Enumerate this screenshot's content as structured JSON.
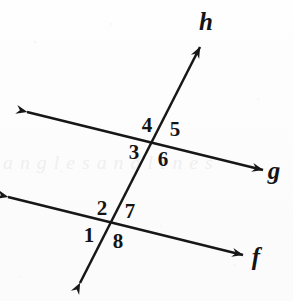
{
  "figure": {
    "background_color": "#fdfdfd",
    "ink_color": "#171717",
    "width": 293,
    "height": 301
  },
  "lines": [
    {
      "id": "line-h",
      "label": "h",
      "role": "transversal",
      "label_x": 206,
      "label_y": 24,
      "x1": 80,
      "y1": 283,
      "x2": 200,
      "y2": 47,
      "arrow_start": true,
      "arrow_end": true
    },
    {
      "id": "line-g",
      "label": "g",
      "role": "parallel-upper",
      "label_x": 274,
      "label_y": 173,
      "x1": 27,
      "y1": 112,
      "x2": 263,
      "y2": 170,
      "arrow_start": true,
      "arrow_end": true
    },
    {
      "id": "line-f",
      "label": "f",
      "role": "parallel-lower",
      "label_x": 256,
      "label_y": 259,
      "x1": 8,
      "y1": 197,
      "x2": 243,
      "y2": 255,
      "arrow_start": true,
      "arrow_end": true
    }
  ],
  "intersections": [
    {
      "id": "intersection-upper",
      "of": "h-and-g",
      "x": 155,
      "y": 143
    },
    {
      "id": "intersection-lower",
      "of": "h-and-f",
      "x": 110,
      "y": 225
    }
  ],
  "angle_labels": [
    {
      "id": "angle-4",
      "text": "4",
      "x": 147,
      "y": 127,
      "intersection": "intersection-upper",
      "position": "upper-left"
    },
    {
      "id": "angle-5",
      "text": "5",
      "x": 175,
      "y": 131,
      "intersection": "intersection-upper",
      "position": "upper-right"
    },
    {
      "id": "angle-3",
      "text": "3",
      "x": 134,
      "y": 154,
      "intersection": "intersection-upper",
      "position": "lower-left"
    },
    {
      "id": "angle-6",
      "text": "6",
      "x": 163,
      "y": 161,
      "intersection": "intersection-upper",
      "position": "lower-right"
    },
    {
      "id": "angle-2",
      "text": "2",
      "x": 102,
      "y": 210,
      "intersection": "intersection-lower",
      "position": "upper-left"
    },
    {
      "id": "angle-7",
      "text": "7",
      "x": 130,
      "y": 213,
      "intersection": "intersection-lower",
      "position": "upper-right"
    },
    {
      "id": "angle-1",
      "text": "1",
      "x": 89,
      "y": 237,
      "intersection": "intersection-lower",
      "position": "lower-left"
    },
    {
      "id": "angle-8",
      "text": "8",
      "x": 118,
      "y": 243,
      "intersection": "intersection-lower",
      "position": "lower-right"
    }
  ],
  "watermark": {
    "text": "a n g l e s   a n d   l i n e s"
  }
}
